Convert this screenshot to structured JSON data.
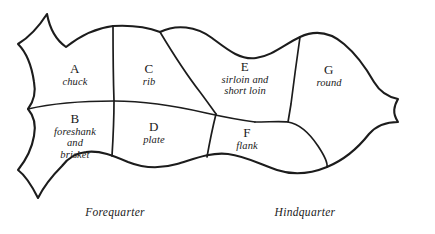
{
  "diagram": {
    "stroke_color": "#1c1c1c",
    "background_color": "#ffffff",
    "cuts": [
      {
        "letter": "A",
        "name": "chuck",
        "name_lines": [
          "chuck"
        ]
      },
      {
        "letter": "B",
        "name": "foreshank and brisket",
        "name_lines": [
          "foreshank",
          "and",
          "brisket"
        ]
      },
      {
        "letter": "C",
        "name": "rib",
        "name_lines": [
          "rib"
        ]
      },
      {
        "letter": "D",
        "name": "plate",
        "name_lines": [
          "plate"
        ]
      },
      {
        "letter": "E",
        "name": "sirloin and short loin",
        "name_lines": [
          "sirloin and",
          "short loin"
        ]
      },
      {
        "letter": "F",
        "name": "flank",
        "name_lines": [
          "flank"
        ]
      },
      {
        "letter": "G",
        "name": "round",
        "name_lines": [
          "round"
        ]
      }
    ],
    "captions": {
      "left": "Forequarter",
      "right": "Hindquarter"
    }
  }
}
